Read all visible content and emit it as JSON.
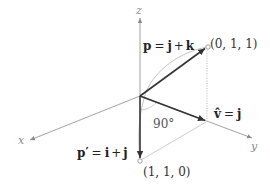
{
  "diagram": {
    "axes": {
      "x_label": "x",
      "y_label": "y",
      "z_label": "z"
    },
    "vectors": {
      "p": {
        "name": "p",
        "eq": "=",
        "rhs_1": "j",
        "plus": "+",
        "rhs_2": "k",
        "point_label": "(0, 1, 1)"
      },
      "v_hat": {
        "name": "v̂",
        "eq": "=",
        "rhs": "j"
      },
      "p_prime": {
        "name": "p′",
        "eq": "=",
        "rhs_1": "i",
        "plus": "+",
        "rhs_2": "j",
        "point_label": "(1, 1, 0)"
      }
    },
    "angle_label": "90°",
    "colors": {
      "axis": "#8a8a8a",
      "vector": "#333333",
      "dotted": "#9a9a9a",
      "arc": "#bdbdbd"
    }
  }
}
